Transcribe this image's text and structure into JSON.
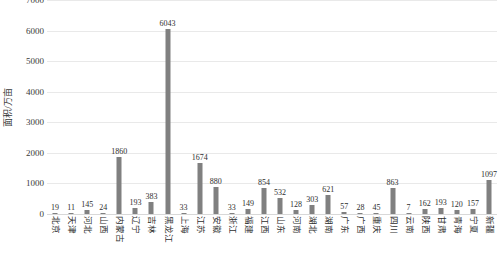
{
  "chart_data": {
    "type": "bar",
    "title": "",
    "subtitle": "",
    "xlabel": "",
    "ylabel": "面积/万亩",
    "ylim": [
      0,
      7000
    ],
    "y_ticks": [
      0,
      1000,
      2000,
      3000,
      4000,
      5000,
      6000,
      7000
    ],
    "grid": true,
    "legend": null,
    "bar_color": "#808080",
    "gridline_color": "#e9e9e9",
    "categories": [
      "北京",
      "天津",
      "河北",
      "山西",
      "内蒙古",
      "辽宁",
      "吉林",
      "黑龙江",
      "上海",
      "江苏",
      "安徽",
      "浙江",
      "福建",
      "江西",
      "山东",
      "河南",
      "湖北",
      "湖南",
      "广东",
      "广西",
      "重庆",
      "四川",
      "云南",
      "陕西",
      "甘肃",
      "青海",
      "宁夏",
      "新疆"
    ],
    "values": [
      19,
      11,
      145,
      24,
      1860,
      193,
      383,
      6043,
      33,
      1674,
      880,
      33,
      149,
      854,
      532,
      128,
      303,
      621,
      57,
      28,
      45,
      863,
      7,
      162,
      193,
      120,
      157,
      1097
    ]
  }
}
